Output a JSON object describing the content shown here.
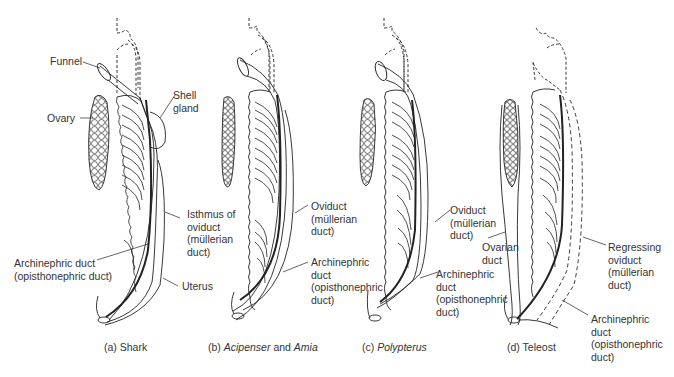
{
  "figure": {
    "panels": [
      {
        "id": "a",
        "caption_prefix": "(a)",
        "caption_name": "Shark",
        "caption_italic": false,
        "labels": {
          "funnel": "Funnel",
          "ovary": "Ovary",
          "shell_gland_1": "Shell",
          "shell_gland_2": "gland",
          "isthmus_1": "Isthmus of",
          "isthmus_2": "oviduct",
          "isthmus_3": "(müllerian",
          "isthmus_4": "duct)",
          "archinephric_1": "Archinephric duct",
          "archinephric_2": "(opisthonephric duct)",
          "uterus": "Uterus"
        }
      },
      {
        "id": "b",
        "caption_prefix": "(b)",
        "caption_name_1": "Acipenser",
        "caption_joiner": "and",
        "caption_name_2": "Amia",
        "labels": {
          "oviduct_1": "Oviduct",
          "oviduct_2": "(müllerian",
          "oviduct_3": "duct)",
          "archinephric_1": "Archinephric",
          "archinephric_2": "duct",
          "archinephric_3": "(opisthonephric",
          "archinephric_4": "duct)"
        }
      },
      {
        "id": "c",
        "caption_prefix": "(c)",
        "caption_name": "Polypterus",
        "labels": {
          "oviduct_1": "Oviduct",
          "oviduct_2": "(müllerian",
          "oviduct_3": "duct)",
          "archinephric_1": "Archinephric",
          "archinephric_2": "duct",
          "archinephric_3": "(opisthonephric",
          "archinephric_4": "duct)"
        }
      },
      {
        "id": "d",
        "caption_prefix": "(d)",
        "caption_name": "Teleost",
        "labels": {
          "ovarian_1": "Ovarian",
          "ovarian_2": "duct",
          "regressing_1": "Regressing",
          "regressing_2": "oviduct",
          "regressing_3": "(müllerian",
          "regressing_4": "duct)",
          "archinephric_1": "Archinephric",
          "archinephric_2": "duct",
          "archinephric_3": "(opisthonephric",
          "archinephric_4": "duct)"
        }
      }
    ]
  }
}
